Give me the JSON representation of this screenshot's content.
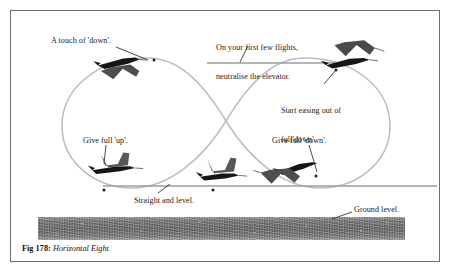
{
  "figure": {
    "caption_label": "Fig 178:",
    "caption_title": "Horizontal Eight",
    "border_color": "#6e6e72",
    "path_color": "#b9b9b9",
    "reference_line_color": "#9a9a9a",
    "ground_color": "#646464",
    "aircraft_color": "#3a3a3a",
    "text_color": "#1a1a1a"
  },
  "annotations": [
    {
      "id": "touch-of-down",
      "text": "A touch of 'down'.",
      "lines": [
        "A touch of 'down'."
      ],
      "x": 51,
      "y": 36
    },
    {
      "id": "neutralise-elevator",
      "text": "On your first few flights, neutralise the elevator.",
      "lines": [
        "On your first few flights,",
        "neutralise the elevator."
      ],
      "x": 216,
      "y": 24
    },
    {
      "id": "start-easing-out",
      "text": "Start easing out of full'down'.",
      "lines": [
        "Start easing out of",
        "full'down'."
      ],
      "x": 281,
      "y": 87
    },
    {
      "id": "give-full-up",
      "text": "Give full 'up'.",
      "lines": [
        "Give full 'up'."
      ],
      "x": 83,
      "y": 136
    },
    {
      "id": "give-full-down",
      "text": "Give full 'down'.",
      "lines": [
        "Give full 'down'."
      ],
      "x": 272,
      "y": 136
    },
    {
      "id": "straight-and-level",
      "text": "Straight and level.",
      "lines": [
        "Straight and level."
      ],
      "x": 134,
      "y": 196
    },
    {
      "id": "ground-level",
      "text": "Ground level.",
      "lines": [
        "Ground level."
      ],
      "x": 354,
      "y": 205
    }
  ],
  "diagram": {
    "left_loop_center": [
      128,
      122
    ],
    "right_loop_center": [
      325,
      122
    ],
    "crossover_point": [
      226,
      121
    ],
    "reference_lines": [
      {
        "id": "upper-reference-line",
        "x1": 207,
        "y1": 63,
        "x2": 345,
        "y2": 63
      },
      {
        "id": "lower-reference-line",
        "x1": 103,
        "y1": 186,
        "x2": 437,
        "y2": 186
      }
    ],
    "aircraft": [
      {
        "id": "aircraft-top-left-inverted",
        "x": 120,
        "y": 64,
        "attitude": "inverted"
      },
      {
        "id": "aircraft-top-right-inverted",
        "x": 355,
        "y": 55,
        "attitude": "inverted"
      },
      {
        "id": "aircraft-left-climb",
        "x": 116,
        "y": 163,
        "attitude": "pulling-up"
      },
      {
        "id": "aircraft-center-level",
        "x": 220,
        "y": 172,
        "attitude": "level"
      },
      {
        "id": "aircraft-right-descend",
        "x": 292,
        "y": 170,
        "attitude": "pushing-down"
      }
    ],
    "markers": [
      {
        "id": "marker-top-left",
        "x": 154,
        "y": 60
      },
      {
        "id": "marker-top-right",
        "x": 336,
        "y": 69
      },
      {
        "id": "marker-left-bottom",
        "x": 104,
        "y": 190
      },
      {
        "id": "marker-center-bottom",
        "x": 213,
        "y": 190
      },
      {
        "id": "marker-right-bottom",
        "x": 316,
        "y": 176
      }
    ]
  }
}
